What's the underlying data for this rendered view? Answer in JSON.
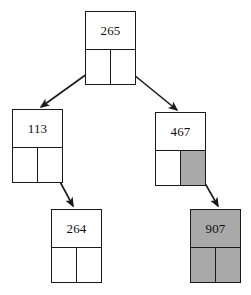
{
  "diagram": {
    "type": "binary-tree",
    "colors": {
      "stroke": "#1a1a1a",
      "node_fill": "#ffffff",
      "shaded_fill": "#a9a9a9",
      "text": "#101010",
      "background": "#ffffff"
    },
    "nodes": [
      {
        "id": "root",
        "key": "265",
        "shaded": false,
        "left_ptr_shaded": false,
        "right_ptr_shaded": false,
        "x": 85,
        "y": 11,
        "w": 51,
        "h": 74,
        "key_h": 38
      },
      {
        "id": "left-child",
        "key": "113",
        "shaded": false,
        "left_ptr_shaded": false,
        "right_ptr_shaded": false,
        "x": 12,
        "y": 109,
        "w": 51,
        "h": 74,
        "key_h": 38
      },
      {
        "id": "right-child",
        "key": "467",
        "shaded": false,
        "left_ptr_shaded": false,
        "right_ptr_shaded": true,
        "x": 155,
        "y": 112,
        "w": 51,
        "h": 74,
        "key_h": 38
      },
      {
        "id": "left-right-grandchild",
        "key": "264",
        "shaded": false,
        "left_ptr_shaded": false,
        "right_ptr_shaded": false,
        "x": 51,
        "y": 209,
        "w": 51,
        "h": 74,
        "key_h": 38
      },
      {
        "id": "right-right-grandchild",
        "key": "907",
        "shaded": true,
        "left_ptr_shaded": true,
        "right_ptr_shaded": true,
        "x": 190,
        "y": 209,
        "w": 51,
        "h": 74,
        "key_h": 38
      }
    ],
    "edges": [
      {
        "id": "edge-root-left",
        "from": "root",
        "from_ptr": "left",
        "to": "left-child",
        "x1": 98,
        "y1": 66,
        "x2": 41,
        "y2": 107
      },
      {
        "id": "edge-root-right",
        "from": "root",
        "from_ptr": "right",
        "to": "right-child",
        "x1": 123,
        "y1": 66,
        "x2": 177,
        "y2": 110
      },
      {
        "id": "edge-left-right",
        "from": "left-child",
        "from_ptr": "right",
        "to": "left-right-grandchild",
        "x1": 50,
        "y1": 163,
        "x2": 73,
        "y2": 206
      },
      {
        "id": "edge-right-right",
        "from": "right-child",
        "from_ptr": "right",
        "to": "right-right-grandchild",
        "x1": 194,
        "y1": 164,
        "x2": 218,
        "y2": 206
      }
    ]
  }
}
